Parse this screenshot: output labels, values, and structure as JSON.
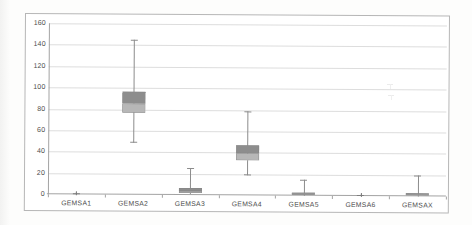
{
  "chart_data": {
    "type": "boxplot",
    "title": "",
    "xlabel": "",
    "ylabel": "",
    "categories": [
      "GEMSA1",
      "GEMSA2",
      "GEMSA3",
      "GEMSA4",
      "GEMSA5",
      "GEMSA6",
      "GEMSAX"
    ],
    "series": [
      {
        "name": "GEMSA1",
        "min": 0,
        "q1": 1,
        "median": 1,
        "q3": 1,
        "max": 2
      },
      {
        "name": "GEMSA2",
        "min": 49,
        "q1": 77,
        "median": 85,
        "q3": 96,
        "max": 145
      },
      {
        "name": "GEMSA3",
        "min": 1,
        "q1": 2,
        "median": 4,
        "q3": 7,
        "max": 25
      },
      {
        "name": "GEMSA4",
        "min": 19,
        "q1": 33,
        "median": 39,
        "q3": 47,
        "max": 79
      },
      {
        "name": "GEMSA5",
        "min": 0,
        "q1": 0.5,
        "median": 1.5,
        "q3": 2.5,
        "max": 15
      },
      {
        "name": "GEMSA6",
        "min": 0,
        "q1": 1,
        "median": 1,
        "q3": 1,
        "max": 2
      },
      {
        "name": "GEMSAX",
        "min": 0,
        "q1": 0.5,
        "median": 1.5,
        "q3": 2.5,
        "max": 20
      }
    ],
    "ylim": [
      0,
      160
    ],
    "yticks": [
      0,
      20,
      40,
      60,
      80,
      100,
      120,
      140,
      160
    ],
    "grid": true,
    "legend_position": "none"
  },
  "colors": {
    "chart_border": "#b6b6b6",
    "gridline": "#dddddd",
    "axis_line": "#a3a3a3",
    "tick_label": "#4d4d4d",
    "whisker": "#8c8c8c",
    "box_upper": "#8d8d8d",
    "box_lower": "#b7b7b7",
    "box_border": "#848484",
    "mini_mark": "#7d7d7d"
  },
  "artifacts": {
    "ghost_marks": [
      {
        "x": 390,
        "y": 84
      },
      {
        "x": 391,
        "y": 95
      }
    ]
  }
}
